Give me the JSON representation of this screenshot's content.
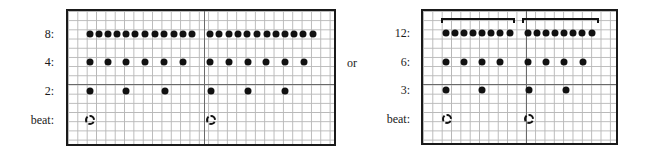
{
  "separator_text": "or",
  "panels": [
    {
      "id": "left",
      "rows": [
        {
          "label": "8:",
          "y": 34,
          "dots": [
            90,
            99,
            108,
            117,
            126,
            135,
            145,
            155,
            164,
            174,
            183,
            192,
            210,
            219,
            229,
            238,
            247,
            257,
            267,
            276,
            285,
            294,
            303,
            313
          ]
        },
        {
          "label": "4:",
          "y": 62,
          "dots": [
            90,
            108,
            126,
            145,
            164,
            183,
            210,
            229,
            248,
            266,
            285,
            304
          ]
        },
        {
          "label": "2:",
          "y": 91,
          "dots": [
            90,
            126,
            165,
            211,
            248,
            285
          ]
        },
        {
          "label": "beat:",
          "y": 120,
          "beats": [
            90,
            211
          ]
        }
      ]
    },
    {
      "id": "right",
      "brackets": [
        {
          "x1": 441,
          "x2": 515
        },
        {
          "x1": 522,
          "x2": 599
        }
      ],
      "rows": [
        {
          "label": "12:",
          "y": 33,
          "dots": [
            446,
            455,
            464,
            473,
            482,
            491,
            500,
            510,
            528,
            537,
            546,
            555,
            564,
            573,
            582,
            592
          ]
        },
        {
          "label": "6:",
          "y": 62,
          "dots": [
            446,
            464,
            482,
            500,
            528,
            546,
            564,
            583
          ]
        },
        {
          "label": "3:",
          "y": 90,
          "dots": [
            446,
            482,
            529,
            566
          ]
        },
        {
          "label": "beat:",
          "y": 119,
          "beats": [
            447,
            529
          ]
        }
      ]
    }
  ]
}
